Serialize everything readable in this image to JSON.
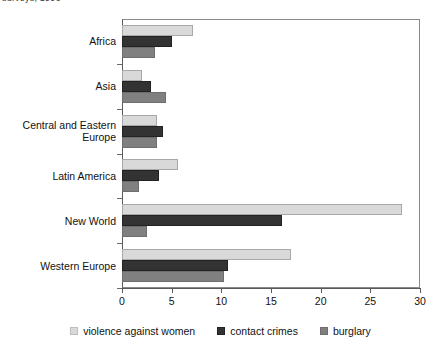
{
  "title_fragment": "surveys, 1996",
  "chart_data": {
    "type": "bar",
    "orientation": "horizontal",
    "title": "surveys, 1996",
    "xlabel": "",
    "ylabel": "",
    "xlim": [
      0,
      30
    ],
    "xticks": [
      0,
      5,
      10,
      15,
      20,
      25,
      30
    ],
    "grid": false,
    "legend_position": "bottom",
    "categories": [
      "Africa",
      "Asia",
      "Central and Eastern Europe",
      "Latin America",
      "New World",
      "Western Europe"
    ],
    "series": [
      {
        "name": "violence against women",
        "color": "#d9d9d9",
        "values": [
          7.1,
          2.0,
          3.5,
          5.6,
          28.2,
          17.0
        ]
      },
      {
        "name": "contact crimes",
        "color": "#333333",
        "values": [
          5.0,
          2.9,
          4.1,
          3.7,
          16.1,
          10.7
        ]
      },
      {
        "name": "burglary",
        "color": "#808080",
        "values": [
          3.3,
          4.4,
          3.5,
          1.7,
          2.5,
          10.3
        ]
      }
    ]
  },
  "axis": {
    "tick_labels": [
      "0",
      "5",
      "10",
      "15",
      "20",
      "25",
      "30"
    ]
  },
  "legend": {
    "items": [
      {
        "label": "violence against women",
        "color": "#d9d9d9"
      },
      {
        "label": "contact crimes",
        "color": "#333333"
      },
      {
        "label": "burglary",
        "color": "#808080"
      }
    ]
  }
}
